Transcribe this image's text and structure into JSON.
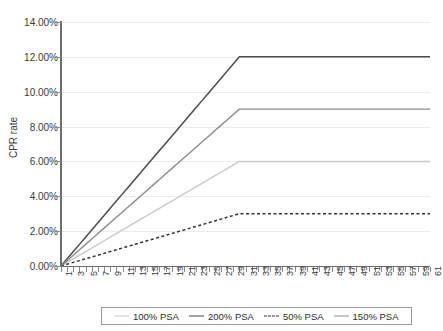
{
  "chart_data": {
    "type": "line",
    "title": "",
    "xlabel": "",
    "ylabel": "CPR rate",
    "ylim": [
      0,
      14
    ],
    "xlim": [
      1,
      61
    ],
    "grid": true,
    "legend_position": "bottom",
    "y_ticks": [
      "0.00%",
      "2.00%",
      "4.00%",
      "6.00%",
      "8.00%",
      "10.00%",
      "12.00%",
      "14.00%"
    ],
    "y_tick_values": [
      0,
      2,
      4,
      6,
      8,
      10,
      12,
      14
    ],
    "x": [
      1,
      2,
      3,
      4,
      5,
      6,
      7,
      8,
      9,
      10,
      11,
      12,
      13,
      14,
      15,
      16,
      17,
      18,
      19,
      20,
      21,
      22,
      23,
      24,
      25,
      26,
      27,
      28,
      29,
      30,
      31,
      32,
      33,
      34,
      35,
      36,
      37,
      38,
      39,
      40,
      41,
      42,
      43,
      44,
      45,
      46,
      47,
      48,
      49,
      50,
      51,
      52,
      53,
      54,
      55,
      56,
      57,
      58,
      59,
      60,
      61
    ],
    "x_tick_labels": [
      "1",
      "3",
      "5",
      "7",
      "9",
      "11",
      "13",
      "15",
      "17",
      "19",
      "21",
      "23",
      "25",
      "27",
      "29",
      "31",
      "33",
      "35",
      "37",
      "39",
      "41",
      "43",
      "45",
      "47",
      "49",
      "51",
      "53",
      "55",
      "57",
      "59",
      "61"
    ],
    "x_tick_values": [
      1,
      3,
      5,
      7,
      9,
      11,
      13,
      15,
      17,
      19,
      21,
      23,
      25,
      27,
      29,
      31,
      33,
      35,
      37,
      39,
      41,
      43,
      45,
      47,
      49,
      51,
      53,
      55,
      57,
      59,
      61
    ],
    "series": [
      {
        "name": "100% PSA",
        "color": "#c9c9c9",
        "width": 1.4,
        "dash": "none",
        "plateau_month": 30,
        "plateau_value": 6.0,
        "values": [
          0,
          0.207,
          0.414,
          0.621,
          0.828,
          1.034,
          1.241,
          1.448,
          1.655,
          1.862,
          2.069,
          2.276,
          2.483,
          2.69,
          2.897,
          3.103,
          3.31,
          3.517,
          3.724,
          3.931,
          4.138,
          4.345,
          4.552,
          4.759,
          4.966,
          5.172,
          5.379,
          5.586,
          5.793,
          6.0,
          6.0,
          6.0,
          6.0,
          6.0,
          6.0,
          6.0,
          6.0,
          6.0,
          6.0,
          6.0,
          6.0,
          6.0,
          6.0,
          6.0,
          6.0,
          6.0,
          6.0,
          6.0,
          6.0,
          6.0,
          6.0,
          6.0,
          6.0,
          6.0,
          6.0,
          6.0,
          6.0,
          6.0,
          6.0,
          6.0,
          6.0
        ]
      },
      {
        "name": "200% PSA",
        "color": "#4d4d4d",
        "width": 1.5,
        "dash": "none",
        "plateau_month": 30,
        "plateau_value": 12.0,
        "values": [
          0,
          0.414,
          0.828,
          1.241,
          1.655,
          2.069,
          2.483,
          2.897,
          3.31,
          3.724,
          4.138,
          4.552,
          4.966,
          5.379,
          5.793,
          6.207,
          6.621,
          7.034,
          7.448,
          7.862,
          8.276,
          8.69,
          9.103,
          9.517,
          9.931,
          10.345,
          10.759,
          11.172,
          11.586,
          12.0,
          12.0,
          12.0,
          12.0,
          12.0,
          12.0,
          12.0,
          12.0,
          12.0,
          12.0,
          12.0,
          12.0,
          12.0,
          12.0,
          12.0,
          12.0,
          12.0,
          12.0,
          12.0,
          12.0,
          12.0,
          12.0,
          12.0,
          12.0,
          12.0,
          12.0,
          12.0,
          12.0,
          12.0,
          12.0,
          12.0,
          12.0
        ]
      },
      {
        "name": "50% PSA",
        "color": "#333333",
        "width": 1.5,
        "dash": "3,2.5",
        "plateau_month": 30,
        "plateau_value": 3.0,
        "values": [
          0,
          0.103,
          0.207,
          0.31,
          0.414,
          0.517,
          0.621,
          0.724,
          0.828,
          0.931,
          1.034,
          1.138,
          1.241,
          1.345,
          1.448,
          1.552,
          1.655,
          1.759,
          1.862,
          1.966,
          2.069,
          2.172,
          2.276,
          2.379,
          2.483,
          2.586,
          2.69,
          2.793,
          2.897,
          3.0,
          3.0,
          3.0,
          3.0,
          3.0,
          3.0,
          3.0,
          3.0,
          3.0,
          3.0,
          3.0,
          3.0,
          3.0,
          3.0,
          3.0,
          3.0,
          3.0,
          3.0,
          3.0,
          3.0,
          3.0,
          3.0,
          3.0,
          3.0,
          3.0,
          3.0,
          3.0,
          3.0,
          3.0,
          3.0,
          3.0,
          3.0
        ]
      },
      {
        "name": "150% PSA",
        "color": "#8c8c8c",
        "width": 1.4,
        "dash": "none",
        "plateau_month": 30,
        "plateau_value": 9.0,
        "values": [
          0,
          0.31,
          0.621,
          0.931,
          1.241,
          1.552,
          1.862,
          2.172,
          2.483,
          2.793,
          3.103,
          3.414,
          3.724,
          4.034,
          4.345,
          4.655,
          4.966,
          5.276,
          5.586,
          5.897,
          6.207,
          6.517,
          6.828,
          7.138,
          7.448,
          7.759,
          8.069,
          8.379,
          8.69,
          9.0,
          9.0,
          9.0,
          9.0,
          9.0,
          9.0,
          9.0,
          9.0,
          9.0,
          9.0,
          9.0,
          9.0,
          9.0,
          9.0,
          9.0,
          9.0,
          9.0,
          9.0,
          9.0,
          9.0,
          9.0,
          9.0,
          9.0,
          9.0,
          9.0,
          9.0,
          9.0,
          9.0,
          9.0,
          9.0,
          9.0,
          9.0
        ]
      }
    ]
  },
  "legend": {
    "items": [
      {
        "label": "100% PSA"
      },
      {
        "label": "200% PSA"
      },
      {
        "label": "50% PSA"
      },
      {
        "label": "150% PSA"
      }
    ]
  },
  "colors": {
    "gridline": "#ececec",
    "axis": "#6e6e6e",
    "text": "#3a3a3a",
    "background": "#ffffff",
    "legend_border": "#9a9a9a"
  }
}
